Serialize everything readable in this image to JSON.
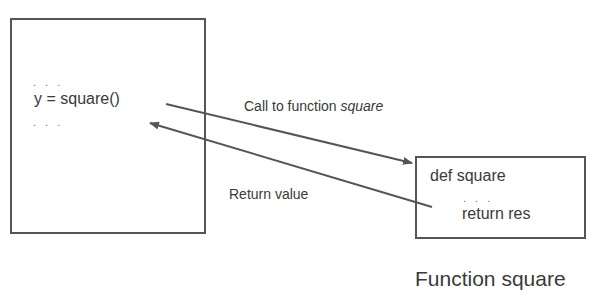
{
  "caller": {
    "dots_top": ". . .",
    "code_line": "y = square()",
    "dots_bottom": ". . ."
  },
  "callee": {
    "def_line": "def square",
    "dots": ". . .",
    "return_line": "return res",
    "caption": "Function square"
  },
  "arrows": {
    "call": {
      "label_prefix": "Call to function ",
      "label_italic": "square",
      "from": [
        166,
        104
      ],
      "to": [
        412,
        163
      ]
    },
    "return": {
      "label": "Return value",
      "from": [
        432,
        207
      ],
      "to": [
        150,
        123
      ]
    }
  },
  "colors": {
    "stroke": "#555555",
    "text": "#3a3a3a"
  }
}
